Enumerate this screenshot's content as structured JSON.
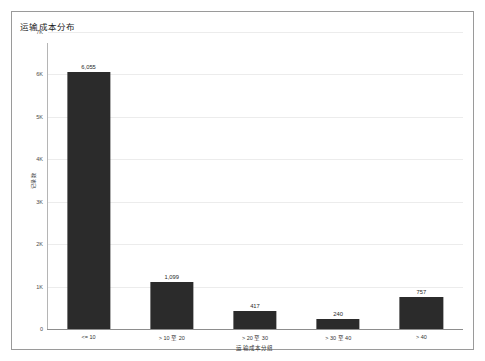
{
  "chart_data": {
    "type": "bar",
    "title": "运输成本分布",
    "xlabel": "运输成本分组",
    "ylabel": "记录数",
    "categories": [
      "<= 10",
      "> 10 至 20",
      "> 20 至 30",
      "> 30 至 40",
      "> 40"
    ],
    "values": [
      6055,
      1099,
      417,
      240,
      757
    ],
    "value_labels": [
      "6,055",
      "1,099",
      "417",
      "240",
      "757"
    ],
    "ylim": [
      0,
      7000
    ],
    "yticks": [
      0,
      1000,
      2000,
      3000,
      4000,
      5000,
      6000,
      7000
    ],
    "ytick_labels": [
      "0",
      "1K",
      "2K",
      "3K",
      "4K",
      "5K",
      "6K",
      "7K"
    ],
    "grid": true,
    "legend": false,
    "bar_color": "#2b2b2b",
    "grid_color": "#ececec",
    "axis_color": "#8d8d8d",
    "frame_color": "#9a9a9a",
    "background": "#ffffff"
  }
}
